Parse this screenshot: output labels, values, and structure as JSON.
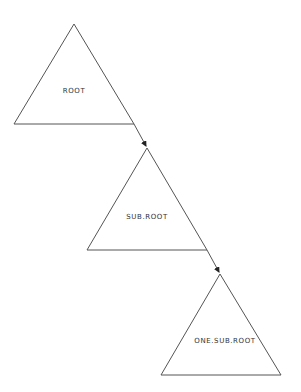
{
  "diagram": {
    "type": "hierarchy",
    "nodes": [
      {
        "id": "root",
        "label": "ROOT"
      },
      {
        "id": "sub_root",
        "label": "SUB.ROOT"
      },
      {
        "id": "one_sub_root",
        "label": "ONE.SUB.ROOT"
      }
    ],
    "edges": [
      {
        "from": "ROOT",
        "to": "SUB.ROOT"
      },
      {
        "from": "SUB.ROOT",
        "to": "ONE.SUB.ROOT"
      }
    ],
    "line_color": "#555555"
  }
}
